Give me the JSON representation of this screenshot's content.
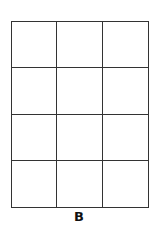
{
  "figure": {
    "label": "B",
    "grid": {
      "rows": 4,
      "columns": 3,
      "line_color": "#333333"
    }
  }
}
